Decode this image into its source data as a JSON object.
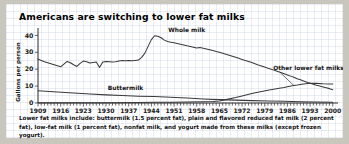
{
  "chart_data": {
    "type": "line",
    "title": "Americans are switching to lower fat milks",
    "xlabel": "",
    "ylabel": "Gallons per person",
    "xlim": [
      1909,
      2001
    ],
    "ylim": [
      0,
      42
    ],
    "yticks": [
      0,
      10,
      20,
      30,
      40
    ],
    "ytick_labels": [
      "0",
      "10",
      "20",
      "30",
      "40"
    ],
    "xticks": [
      1909,
      1916,
      1923,
      1930,
      1937,
      1944,
      1951,
      1958,
      1965,
      1972,
      1979,
      1986,
      1993,
      2000
    ],
    "xtick_labels": [
      "1909",
      "1916",
      "1923",
      "1930",
      "1937",
      "1944",
      "1951",
      "1958",
      "1965",
      "1972",
      "1979",
      "1986",
      "1993",
      "2000"
    ],
    "minor_xtick_interval": 1,
    "grid": false,
    "legend": "inline-annotations",
    "line_color": "#3a3a3a",
    "series": [
      {
        "name": "Whole milk",
        "annotation": "Whole milk",
        "x": [
          1909,
          1910,
          1911,
          1912,
          1913,
          1914,
          1915,
          1916,
          1917,
          1918,
          1919,
          1920,
          1921,
          1922,
          1923,
          1924,
          1925,
          1926,
          1927,
          1928,
          1929,
          1930,
          1931,
          1932,
          1933,
          1934,
          1935,
          1936,
          1937,
          1938,
          1939,
          1940,
          1941,
          1942,
          1943,
          1944,
          1945,
          1946,
          1947,
          1948,
          1949,
          1950,
          1951,
          1952,
          1953,
          1954,
          1955,
          1956,
          1957,
          1958,
          1959,
          1960,
          1961,
          1962,
          1963,
          1964,
          1965,
          1966,
          1967,
          1968,
          1969,
          1970,
          1971,
          1972,
          1973,
          1974,
          1975,
          1976,
          1977,
          1978,
          1979,
          1980,
          1981,
          1982,
          1983,
          1984,
          1985,
          1986,
          1987,
          1988,
          1989,
          1990,
          1991,
          1992,
          1993,
          1994,
          1995,
          1996,
          1997,
          1998,
          1999,
          2000
        ],
        "values": [
          26.0,
          25.2,
          24.4,
          23.8,
          23.2,
          22.6,
          22.0,
          21.4,
          23.0,
          24.6,
          23.8,
          22.6,
          21.6,
          23.4,
          24.8,
          24.4,
          23.6,
          24.0,
          24.2,
          21.0,
          24.3,
          24.6,
          24.4,
          24.2,
          24.4,
          24.9,
          25.1,
          25.0,
          25.1,
          25.0,
          25.2,
          25.4,
          27.0,
          29.5,
          33.5,
          37.5,
          39.8,
          39.5,
          38.6,
          37.2,
          36.4,
          36.0,
          35.6,
          35.2,
          34.8,
          34.3,
          33.8,
          33.4,
          33.0,
          32.5,
          32.8,
          32.4,
          32.0,
          31.5,
          31.0,
          30.5,
          30.0,
          29.4,
          28.8,
          28.2,
          27.6,
          27.0,
          26.4,
          25.8,
          25.2,
          24.6,
          24.0,
          23.2,
          22.5,
          21.9,
          21.3,
          20.6,
          20.0,
          19.3,
          18.7,
          18.0,
          17.3,
          16.6,
          15.9,
          15.2,
          14.4,
          13.7,
          13.0,
          12.3,
          11.7,
          11.1,
          10.5,
          10.0,
          9.5,
          9.0,
          8.5,
          7.9
        ],
        "units": "gallons per person"
      },
      {
        "name": "Buttermilk",
        "annotation": "Buttermilk",
        "x": [
          1909,
          1915,
          1920,
          1925,
          1930,
          1935,
          1940,
          1945,
          1950,
          1955,
          1960,
          1965,
          1970,
          1975,
          1980,
          1985,
          1990,
          1995,
          2000
        ],
        "values": [
          7.2,
          6.5,
          5.9,
          5.3,
          4.8,
          4.4,
          4.0,
          3.8,
          3.4,
          2.9,
          2.4,
          2.0,
          1.7,
          1.4,
          1.2,
          1.0,
          0.8,
          0.6,
          0.5
        ],
        "units": "gallons per person"
      },
      {
        "name": "Other lower fat milks",
        "annotation": "Other lower fat milks",
        "x": [
          1909,
          1920,
          1930,
          1940,
          1945,
          1950,
          1955,
          1960,
          1963,
          1965,
          1967,
          1970,
          1972,
          1975,
          1978,
          1980,
          1983,
          1985,
          1987,
          1989,
          1991,
          1993,
          1995,
          1997,
          1999,
          2000
        ],
        "values": [
          0.2,
          0.2,
          0.2,
          0.3,
          0.4,
          0.5,
          0.6,
          0.8,
          0.9,
          1.2,
          2.0,
          3.2,
          4.2,
          5.6,
          6.8,
          7.6,
          8.6,
          9.2,
          10.0,
          10.6,
          11.3,
          11.7,
          11.6,
          11.4,
          11.3,
          11.2
        ],
        "units": "gallons per person"
      }
    ],
    "footnote": "Lower fat milks include: buttermilk (1.5 percent fat), plain and flavored reduced fat milk (2 percent fat), low-fat milk (1 percent fat), nonfat milk, and yogurt made from these milks (except frozen yogurt)."
  }
}
